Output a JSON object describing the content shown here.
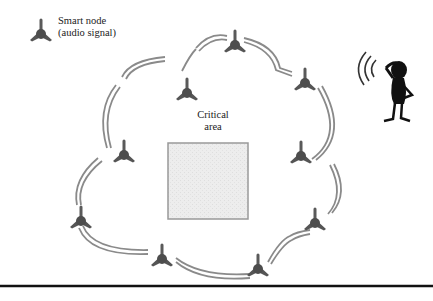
{
  "legend": {
    "icon": "smart-node-icon",
    "line1": "Smart node",
    "line2": "(audio signal)"
  },
  "critical_area": {
    "line1": "Critical",
    "line2": "area"
  },
  "listener": {
    "icon": "person-listening-icon"
  },
  "colors": {
    "node": "#555555",
    "link": "#8a8a8a",
    "area_fill": "#ececec",
    "area_border": "#999999",
    "rule": "#111111"
  },
  "network": {
    "node_count": 11
  }
}
